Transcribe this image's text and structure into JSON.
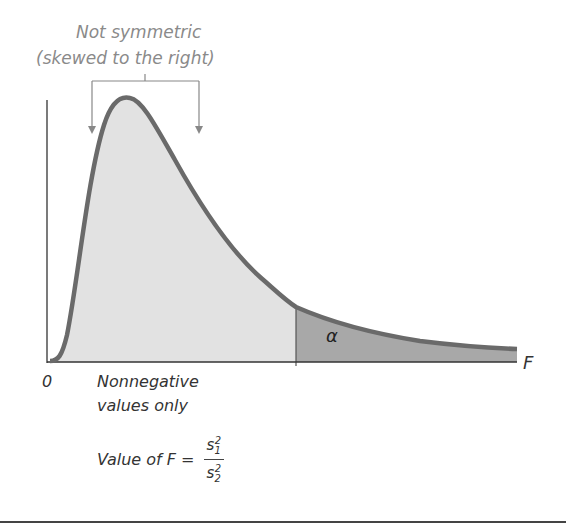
{
  "title_annotation": {
    "line1": "Not symmetric",
    "line2": "(skewed to the right)"
  },
  "axis": {
    "origin_label": "0",
    "x_label": "F"
  },
  "tail": {
    "label": "α",
    "fill_color": "#a8a8a8"
  },
  "body_fill_color": "#e2e2e2",
  "curve_color": "#6a6a6a",
  "notes": {
    "nonnegative_line1": "Nonnegative",
    "nonnegative_line2": "values only",
    "formula_prefix": "Value of F =",
    "numerator": "s",
    "numerator_sub": "1",
    "numerator_sup": "2",
    "denominator": "s",
    "denominator_sub": "2",
    "denominator_sup": "2"
  }
}
